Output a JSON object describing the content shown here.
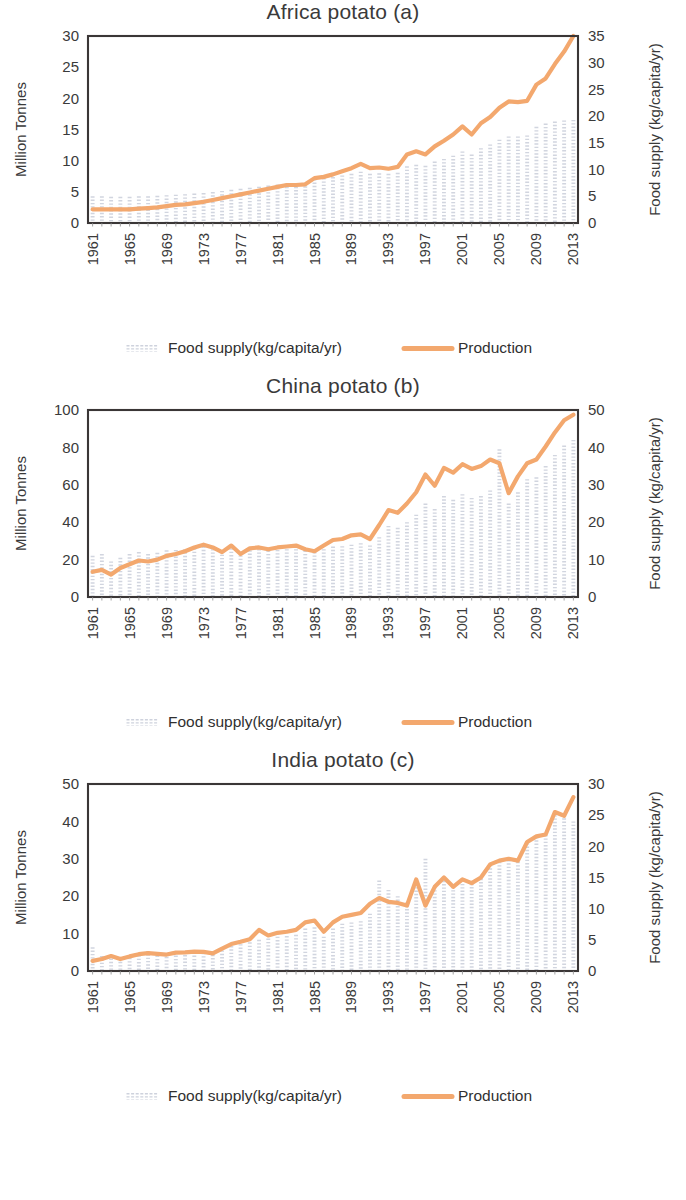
{
  "figure": {
    "background": "#ffffff",
    "series_color_production": "#F3A86E",
    "series_color_foodsupply": "#C9CEDA",
    "axis_color": "#3a3636"
  },
  "legend": {
    "food_supply_label": "Food supply(kg/capita/yr)",
    "production_label": "Production",
    "food_supply_marker": "bars-marker-icon",
    "production_marker": "line-marker-icon"
  },
  "chart_data": [
    {
      "id": "africa-potato",
      "type": "line",
      "title": "Africa potato (a)",
      "xlabel": "",
      "ylabel": "Million Tonnes",
      "y2label": "Food supply (kg/capita/yr)",
      "ylim": [
        0,
        30
      ],
      "yticks": [
        0,
        5,
        10,
        15,
        20,
        25,
        30
      ],
      "y2lim": [
        0,
        35
      ],
      "y2ticks": [
        0,
        5,
        10,
        15,
        20,
        25,
        30,
        35
      ],
      "grid": false,
      "legend_position": "bottom",
      "x": [
        1961,
        1962,
        1963,
        1964,
        1965,
        1966,
        1967,
        1968,
        1969,
        1970,
        1971,
        1972,
        1973,
        1974,
        1975,
        1976,
        1977,
        1978,
        1979,
        1980,
        1981,
        1982,
        1983,
        1984,
        1985,
        1986,
        1987,
        1988,
        1989,
        1990,
        1991,
        1992,
        1993,
        1994,
        1995,
        1996,
        1997,
        1998,
        1999,
        2000,
        2001,
        2002,
        2003,
        2004,
        2005,
        2006,
        2007,
        2008,
        2009,
        2010,
        2011,
        2012,
        2013
      ],
      "xtick_labels": [
        "1961",
        "1965",
        "1969",
        "1973",
        "1977",
        "1981",
        "1985",
        "1989",
        "1993",
        "1997",
        "2001",
        "2005",
        "2009",
        "2013"
      ],
      "series": [
        {
          "name": "Production",
          "unit": "Million Tonnes",
          "axis": "left",
          "values": [
            2.2,
            2.2,
            2.2,
            2.2,
            2.2,
            2.3,
            2.4,
            2.5,
            2.7,
            2.9,
            3.0,
            3.2,
            3.4,
            3.7,
            4.0,
            4.3,
            4.6,
            4.9,
            5.2,
            5.5,
            5.8,
            6.1,
            6.1,
            6.2,
            7.2,
            7.4,
            7.8,
            8.3,
            8.8,
            9.5,
            8.8,
            8.9,
            8.7,
            9.0,
            11.0,
            11.5,
            11.0,
            12.3,
            13.2,
            14.2,
            15.5,
            14.2,
            16.0,
            17.0,
            18.5,
            19.5,
            19.4,
            19.6,
            22.2,
            23.2,
            25.5,
            27.5,
            30.0
          ]
        },
        {
          "name": "Food supply(kg/capita/yr)",
          "unit": "kg/capita/yr",
          "axis": "right",
          "values": [
            5.0,
            5.0,
            4.9,
            4.9,
            4.9,
            5.0,
            5.0,
            5.1,
            5.2,
            5.3,
            5.4,
            5.5,
            5.6,
            5.8,
            6.0,
            6.2,
            6.4,
            6.6,
            6.8,
            7.0,
            7.2,
            7.4,
            7.4,
            7.5,
            8.2,
            8.4,
            8.6,
            8.9,
            9.2,
            9.6,
            9.2,
            9.3,
            9.2,
            9.4,
            10.6,
            10.9,
            10.7,
            11.5,
            12.0,
            12.6,
            13.4,
            12.8,
            14.0,
            14.7,
            15.6,
            16.2,
            16.2,
            16.4,
            18.0,
            18.6,
            19.0,
            19.2,
            19.3
          ]
        }
      ]
    },
    {
      "id": "china-potato",
      "type": "line",
      "title": "China potato (b)",
      "xlabel": "",
      "ylabel": "Million Tonnes",
      "y2label": "Food supply (kg/capita/yr)",
      "ylim": [
        0,
        100
      ],
      "yticks": [
        0,
        20,
        40,
        60,
        80,
        100
      ],
      "y2lim": [
        0,
        50
      ],
      "y2ticks": [
        0,
        10,
        20,
        30,
        40,
        50
      ],
      "grid": false,
      "legend_position": "bottom",
      "x": [
        1961,
        1962,
        1963,
        1964,
        1965,
        1966,
        1967,
        1968,
        1969,
        1970,
        1971,
        1972,
        1973,
        1974,
        1975,
        1976,
        1977,
        1978,
        1979,
        1980,
        1981,
        1982,
        1983,
        1984,
        1985,
        1986,
        1987,
        1988,
        1989,
        1990,
        1991,
        1992,
        1993,
        1994,
        1995,
        1996,
        1997,
        1998,
        1999,
        2000,
        2001,
        2002,
        2003,
        2004,
        2005,
        2006,
        2007,
        2008,
        2009,
        2010,
        2011,
        2012,
        2013
      ],
      "xtick_labels": [
        "1961",
        "1965",
        "1969",
        "1973",
        "1977",
        "1981",
        "1985",
        "1989",
        "1993",
        "1997",
        "2001",
        "2005",
        "2009",
        "2013"
      ],
      "series": [
        {
          "name": "Production",
          "unit": "Million Tonnes",
          "axis": "left",
          "values": [
            13.5,
            14.5,
            12.0,
            15.5,
            17.5,
            19.5,
            19.0,
            20.0,
            22.0,
            23.0,
            24.5,
            26.5,
            28.0,
            26.5,
            24.0,
            27.5,
            23.0,
            26.0,
            26.5,
            25.5,
            26.5,
            27.0,
            27.5,
            25.5,
            24.5,
            27.5,
            30.5,
            31.0,
            33.0,
            33.5,
            31.0,
            38.5,
            46.5,
            45.0,
            50.0,
            56.0,
            65.5,
            59.5,
            69.0,
            66.5,
            71.0,
            68.5,
            70.0,
            73.5,
            71.5,
            55.5,
            64.5,
            71.5,
            73.5,
            80.5,
            88.0,
            94.5,
            97.5
          ]
        },
        {
          "name": "Food supply(kg/capita/yr)",
          "unit": "kg/capita/yr",
          "axis": "right",
          "values": [
            11.0,
            11.5,
            9.5,
            10.5,
            11.5,
            12.0,
            11.5,
            11.8,
            12.5,
            12.6,
            12.8,
            13.0,
            13.5,
            12.8,
            12.2,
            13.0,
            12.0,
            12.5,
            12.8,
            12.4,
            12.6,
            12.8,
            12.8,
            12.4,
            12.0,
            12.8,
            13.5,
            13.6,
            14.0,
            14.4,
            13.8,
            16.0,
            19.0,
            18.5,
            20.0,
            22.0,
            25.0,
            23.5,
            27.0,
            26.0,
            27.5,
            26.5,
            27.0,
            28.5,
            39.5,
            25.0,
            28.0,
            31.5,
            32.0,
            35.0,
            38.0,
            40.5,
            42.0
          ]
        }
      ]
    },
    {
      "id": "india-potato",
      "type": "line",
      "title": "India potato (c)",
      "xlabel": "",
      "ylabel": "Million Tonnes",
      "y2label": "Food supply (kg/capita/yr)",
      "ylim": [
        0,
        50
      ],
      "yticks": [
        0,
        10,
        20,
        30,
        40,
        50
      ],
      "y2lim": [
        0,
        30
      ],
      "y2ticks": [
        0,
        5,
        10,
        15,
        20,
        25,
        30
      ],
      "grid": false,
      "legend_position": "bottom",
      "x": [
        1961,
        1962,
        1963,
        1964,
        1965,
        1966,
        1967,
        1968,
        1969,
        1970,
        1971,
        1972,
        1973,
        1974,
        1975,
        1976,
        1977,
        1978,
        1979,
        1980,
        1981,
        1982,
        1983,
        1984,
        1985,
        1986,
        1987,
        1988,
        1989,
        1990,
        1991,
        1992,
        1993,
        1994,
        1995,
        1996,
        1997,
        1998,
        1999,
        2000,
        2001,
        2002,
        2003,
        2004,
        2005,
        2006,
        2007,
        2008,
        2009,
        2010,
        2011,
        2012,
        2013
      ],
      "xtick_labels": [
        "1961",
        "1965",
        "1969",
        "1973",
        "1977",
        "1981",
        "1985",
        "1989",
        "1993",
        "1997",
        "2001",
        "2005",
        "2009",
        "2013"
      ],
      "series": [
        {
          "name": "Production",
          "unit": "Million Tonnes",
          "axis": "left",
          "values": [
            2.7,
            3.2,
            4.0,
            3.2,
            3.9,
            4.5,
            4.8,
            4.6,
            4.4,
            4.9,
            5.0,
            5.2,
            5.1,
            4.7,
            6.0,
            7.2,
            7.8,
            8.5,
            11.0,
            9.5,
            10.2,
            10.5,
            11.0,
            13.0,
            13.5,
            10.5,
            13.0,
            14.5,
            15.0,
            15.5,
            18.0,
            19.5,
            18.5,
            18.2,
            17.5,
            24.5,
            17.5,
            22.5,
            25.0,
            22.5,
            24.5,
            23.5,
            25.0,
            28.5,
            29.5,
            30.0,
            29.5,
            34.5,
            36.0,
            36.5,
            42.5,
            41.5,
            46.5
          ]
        },
        {
          "name": "Food supply(kg/capita/yr)",
          "unit": "kg/capita/yr",
          "axis": "right",
          "values": [
            3.8,
            2.4,
            2.0,
            2.0,
            2.1,
            2.5,
            3.2,
            3.0,
            2.8,
            3.0,
            3.1,
            3.0,
            2.9,
            2.6,
            3.3,
            4.0,
            4.3,
            4.6,
            5.0,
            5.2,
            5.5,
            5.6,
            5.8,
            6.8,
            7.0,
            5.5,
            6.8,
            7.6,
            7.8,
            8.0,
            9.2,
            14.5,
            13.0,
            12.0,
            11.0,
            14.5,
            18.0,
            13.5,
            15.0,
            13.5,
            14.5,
            14.0,
            14.8,
            17.0,
            17.5,
            17.8,
            17.5,
            20.5,
            21.5,
            21.8,
            25.0,
            24.5,
            24.0
          ]
        }
      ]
    }
  ]
}
